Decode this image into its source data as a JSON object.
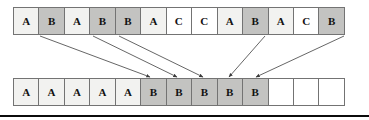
{
  "diagram": {
    "type": "array-partition-mapping",
    "cell_count_per_row": 13,
    "colors": {
      "shade_light": "#f2f2f0",
      "shade_dark": "#c3c3c1",
      "shade_white": "#ffffff",
      "border": "#737373",
      "arrow": "#555555",
      "text": "#121212",
      "bottom_bar": "#0b0b0b"
    },
    "top_row": {
      "name": "source-array",
      "cells": [
        {
          "label": "A",
          "shade": "shade-light"
        },
        {
          "label": "B",
          "shade": "shade-dark"
        },
        {
          "label": "A",
          "shade": "shade-light"
        },
        {
          "label": "B",
          "shade": "shade-dark"
        },
        {
          "label": "B",
          "shade": "shade-dark"
        },
        {
          "label": "A",
          "shade": "shade-light"
        },
        {
          "label": "C",
          "shade": "shade-white"
        },
        {
          "label": "C",
          "shade": "shade-white"
        },
        {
          "label": "A",
          "shade": "shade-light"
        },
        {
          "label": "B",
          "shade": "shade-dark"
        },
        {
          "label": "A",
          "shade": "shade-light"
        },
        {
          "label": "C",
          "shade": "shade-white"
        },
        {
          "label": "B",
          "shade": "shade-dark"
        }
      ]
    },
    "bottom_row": {
      "name": "destination-array",
      "cells": [
        {
          "label": "A",
          "shade": "shade-light"
        },
        {
          "label": "A",
          "shade": "shade-light"
        },
        {
          "label": "A",
          "shade": "shade-light"
        },
        {
          "label": "A",
          "shade": "shade-light"
        },
        {
          "label": "A",
          "shade": "shade-light"
        },
        {
          "label": "B",
          "shade": "shade-dark"
        },
        {
          "label": "B",
          "shade": "shade-dark"
        },
        {
          "label": "B",
          "shade": "shade-dark"
        },
        {
          "label": "B",
          "shade": "shade-dark"
        },
        {
          "label": "B",
          "shade": "shade-dark"
        },
        {
          "label": "",
          "shade": "shade-empty"
        },
        {
          "label": "",
          "shade": "shade-empty"
        },
        {
          "label": "",
          "shade": "shade-empty"
        }
      ]
    },
    "arrows": [
      {
        "name": "arrow-b1",
        "from_index": 1,
        "to_index": 5,
        "x1": 40,
        "y1": 36,
        "x2": 150,
        "y2": 77
      },
      {
        "name": "arrow-b2",
        "from_index": 3,
        "to_index": 6,
        "x1": 93,
        "y1": 36,
        "x2": 177,
        "y2": 77
      },
      {
        "name": "arrow-b3",
        "from_index": 4,
        "to_index": 7,
        "x1": 119,
        "y1": 36,
        "x2": 203,
        "y2": 77
      },
      {
        "name": "arrow-b4",
        "from_index": 9,
        "to_index": 8,
        "x1": 265,
        "y1": 36,
        "x2": 229,
        "y2": 77
      },
      {
        "name": "arrow-b5",
        "from_index": 12,
        "to_index": 9,
        "x1": 344,
        "y1": 36,
        "x2": 256,
        "y2": 77
      }
    ]
  }
}
